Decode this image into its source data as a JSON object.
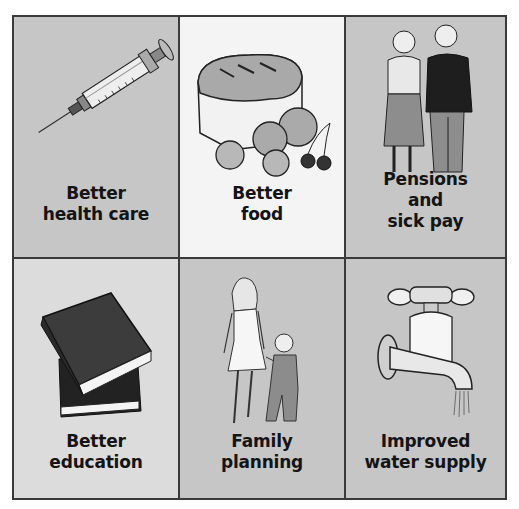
{
  "panels": [
    {
      "id": "health",
      "caption": [
        "Better",
        "health care"
      ],
      "icon": "syringe-icon",
      "background": "#c6c6c6"
    },
    {
      "id": "food",
      "caption": [
        "Better",
        "food"
      ],
      "icon": "bread-and-fruit-icon",
      "background": "#f4f4f4"
    },
    {
      "id": "pensions",
      "caption": [
        "Pensions",
        "and",
        "sick pay"
      ],
      "icon": "elderly-couple-icon",
      "background": "#c6c6c6"
    },
    {
      "id": "education",
      "caption": [
        "Better",
        "education"
      ],
      "icon": "books-icon",
      "background": "#dcdcdc"
    },
    {
      "id": "family",
      "caption": [
        "Family",
        "planning"
      ],
      "icon": "mother-and-child-icon",
      "background": "#c6c6c6"
    },
    {
      "id": "water",
      "caption": [
        "Improved",
        "water supply"
      ],
      "icon": "water-tap-icon",
      "background": "#c6c6c6"
    }
  ]
}
